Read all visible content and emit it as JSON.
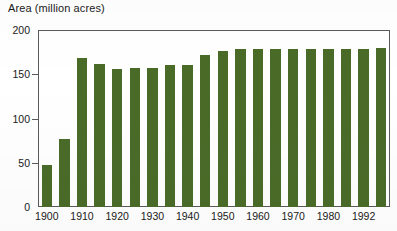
{
  "chart_data": {
    "type": "bar",
    "title": "",
    "ylabel": "Area (million acres)",
    "xlabel": "",
    "ylim": [
      0,
      200
    ],
    "yticks": [
      0,
      50,
      100,
      150,
      200
    ],
    "ytick_labels": [
      "0",
      "50",
      "100",
      "150",
      "200"
    ],
    "xtick_labels": [
      "1900",
      "1910",
      "1920",
      "1930",
      "1940",
      "1950",
      "1960",
      "1970",
      "1980",
      "1992"
    ],
    "grid": false,
    "legend": null,
    "bar_color": "#4a6b28",
    "axis_color": "#5a5a5a",
    "categories": [
      "1900",
      "1905",
      "1910",
      "1915",
      "1920",
      "1925",
      "1930",
      "1935",
      "1940",
      "1945",
      "1950",
      "1955",
      "1960",
      "1965",
      "1970",
      "1975",
      "1980",
      "1985",
      "1990",
      "1992"
    ],
    "values": [
      47,
      77,
      168,
      162,
      156,
      157,
      157,
      161,
      160,
      172,
      176,
      178,
      178,
      178,
      178,
      178,
      178,
      178,
      178,
      180
    ]
  },
  "ylabel_text": "Area (million acres)"
}
